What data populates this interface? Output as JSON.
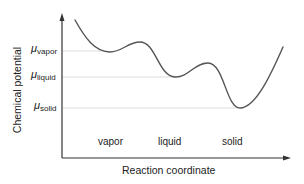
{
  "diagram": {
    "y_axis_label": "Chemical potential",
    "x_axis_label": "Reaction coordinate",
    "levels": [
      {
        "symbol": "μ",
        "subscript": "vapor"
      },
      {
        "symbol": "μ",
        "subscript": "liquid"
      },
      {
        "symbol": "μ",
        "subscript": "solid"
      }
    ],
    "phases": [
      "vapor",
      "liquid",
      "solid"
    ],
    "colors": {
      "curve": "#555555",
      "axis": "#333333",
      "guide_lines": "#dddddd"
    }
  }
}
